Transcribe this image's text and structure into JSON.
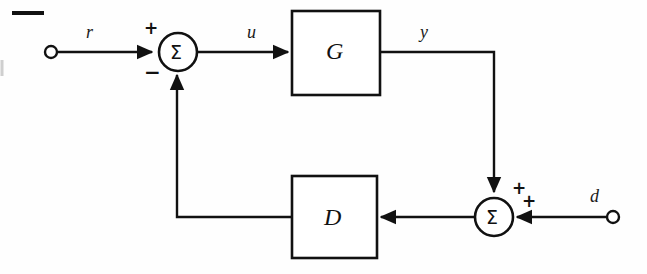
{
  "diagram": {
    "type": "feedback-control-block-diagram",
    "background_color": "#fefefe",
    "stroke_color": "#111111",
    "signals": {
      "reference": "r",
      "control": "u",
      "output": "y",
      "disturbance": "d"
    },
    "blocks": [
      {
        "name": "plant",
        "label": "G"
      },
      {
        "name": "controller",
        "label": "D"
      }
    ],
    "summing_junctions": [
      {
        "name": "error-junction",
        "glyph": "Σ",
        "signs": [
          {
            "value": "+",
            "input": "reference"
          },
          {
            "value": "−",
            "input": "feedback"
          }
        ]
      },
      {
        "name": "disturbance-junction",
        "glyph": "Σ",
        "signs": [
          {
            "value": "+",
            "input": "output"
          },
          {
            "value": "+",
            "input": "disturbance"
          }
        ]
      }
    ],
    "terminals": [
      {
        "name": "reference-terminal",
        "label": "r"
      },
      {
        "name": "disturbance-terminal",
        "label": "d"
      }
    ]
  }
}
